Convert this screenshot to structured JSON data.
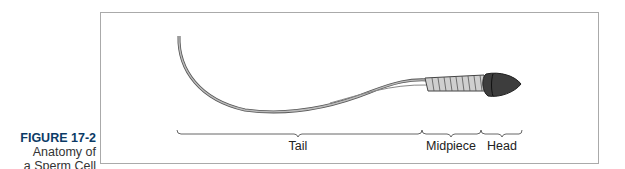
{
  "figure": {
    "number": "FIGURE 17-2",
    "title_line1": "Anatomy of",
    "title_line2": "a Sperm Cell"
  },
  "labels": {
    "tail": "Tail",
    "midpiece": "Midpiece",
    "head": "Head"
  },
  "colors": {
    "figure_number": "#0b3a66",
    "head": "#3a3a3a",
    "midpiece": "#c8c8c8",
    "tail": "#9a9a9a"
  }
}
